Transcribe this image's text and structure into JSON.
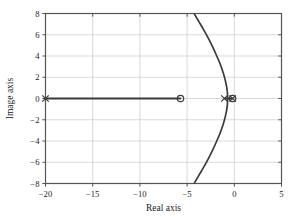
{
  "chart_data": {
    "type": "line",
    "title": "",
    "subtitle": "",
    "xlabel": "Real axis",
    "ylabel": "Image axis",
    "xlim": [
      -20,
      5
    ],
    "ylim": [
      -8,
      8
    ],
    "xticks": [
      -20,
      -15,
      -10,
      -5,
      0,
      5
    ],
    "xtick_labels": [
      "−20",
      "−15",
      "−10",
      "−5",
      "0",
      "5"
    ],
    "yticks": [
      -8,
      -6,
      -4,
      -2,
      0,
      2,
      4,
      6,
      8
    ],
    "ytick_labels": [
      "−8",
      "−6",
      "−4",
      "−2",
      "0",
      "2",
      "4",
      "6",
      "8"
    ],
    "grid": true,
    "legend": "none",
    "plot_kind": "root-locus",
    "line_color": "#3a3a3a",
    "grid_color": "#c8c8c8",
    "axis_color": "#555555",
    "marker_color": "#3a3a3a",
    "series": [
      {
        "name": "real-axis-branch",
        "kind": "segment",
        "x": [
          -20,
          -5.7
        ],
        "y": [
          0,
          0
        ]
      },
      {
        "name": "real-axis-branch-inner",
        "kind": "segment",
        "x": [
          -1.0,
          -0.2
        ],
        "y": [
          0,
          0
        ]
      },
      {
        "name": "complex-branch-upper",
        "kind": "curve",
        "x": [
          -0.7,
          -0.73,
          -0.82,
          -0.98,
          -1.2,
          -1.5,
          -1.88,
          -2.32,
          -2.8,
          -3.3,
          -3.8,
          -4.25
        ],
        "y": [
          0.0,
          0.55,
          1.15,
          1.8,
          2.5,
          3.25,
          4.05,
          4.9,
          5.75,
          6.55,
          7.3,
          8.0
        ]
      },
      {
        "name": "complex-branch-lower",
        "kind": "curve",
        "x": [
          -0.7,
          -0.73,
          -0.82,
          -0.98,
          -1.2,
          -1.5,
          -1.88,
          -2.32,
          -2.8,
          -3.3,
          -3.8,
          -4.25
        ],
        "y": [
          0.0,
          -0.55,
          -1.15,
          -1.8,
          -2.5,
          -3.25,
          -4.05,
          -4.9,
          -5.75,
          -6.55,
          -7.3,
          -8.0
        ]
      }
    ],
    "markers": [
      {
        "name": "pole-at-minus-20",
        "symbol": "x",
        "x": -20.0,
        "y": 0.0
      },
      {
        "name": "pole-at-minus-1",
        "symbol": "x",
        "x": -1.05,
        "y": 0.0
      },
      {
        "name": "pole-at-origin",
        "symbol": "x",
        "x": -0.18,
        "y": 0.0
      },
      {
        "name": "zero-at-minus-5-7",
        "symbol": "o",
        "x": -5.7,
        "y": 0.0
      },
      {
        "name": "zero-near-origin",
        "symbol": "o",
        "x": -0.18,
        "y": 0.0
      }
    ]
  }
}
